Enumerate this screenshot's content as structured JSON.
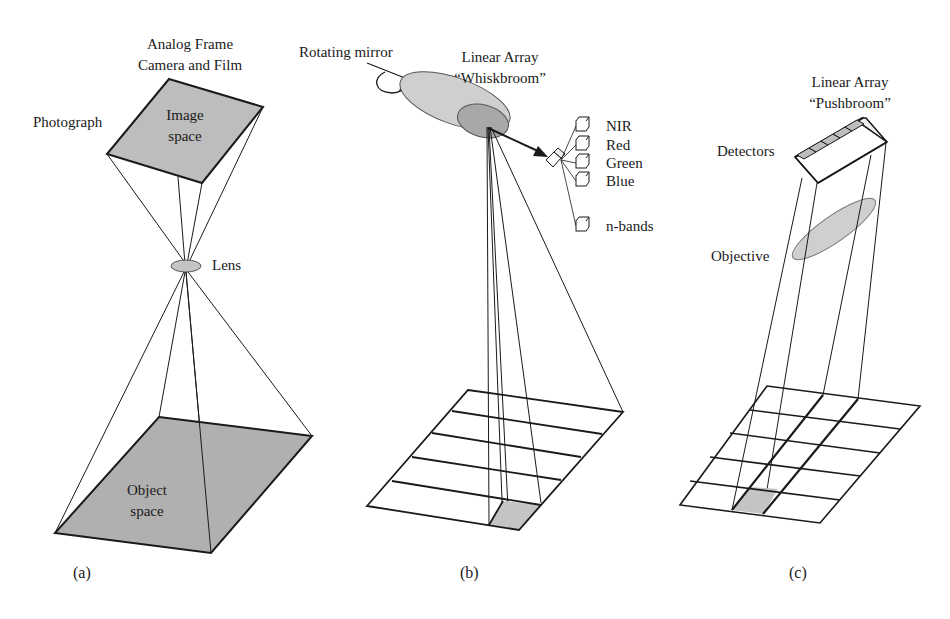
{
  "panels": [
    {
      "id": "a",
      "caption": "(a)",
      "title_line1": "Analog Frame",
      "title_line2": "Camera and Film",
      "labels": {
        "photograph": "Photograph",
        "image_space_1": "Image",
        "image_space_2": "space",
        "lens": "Lens",
        "object_space_1": "Object",
        "object_space_2": "space"
      }
    },
    {
      "id": "b",
      "caption": "(b)",
      "title_line1": "Linear Array",
      "title_line2": "“Whiskbroom”",
      "labels": {
        "rotating_mirror": "Rotating mirror"
      },
      "bands": [
        "NIR",
        "Red",
        "Green",
        "Blue",
        "n-bands"
      ],
      "grid_rows": 5
    },
    {
      "id": "c",
      "caption": "(c)",
      "title_line1": "Linear Array",
      "title_line2": "“Pushbroom”",
      "labels": {
        "detectors": "Detectors",
        "objective": "Objective"
      },
      "grid_rows": 5,
      "grid_cols": 4
    }
  ],
  "colors": {
    "fill_gray": "#bdbdbd",
    "fill_light": "#cfcfcf",
    "fill_dark": "#a8a8a8",
    "line": "#1a1a1a"
  }
}
